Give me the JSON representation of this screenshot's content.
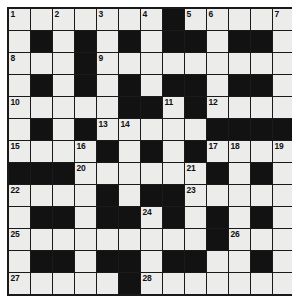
{
  "puzzle": {
    "type": "crossword-grid",
    "rows": 13,
    "cols": 13,
    "colors": {
      "white_cell": "#ececeb",
      "black_cell": "#121212",
      "grid_line": "#1a1a1a",
      "number_text": "#111111",
      "page_background": "#ffffff"
    },
    "layout": [
      [
        "W",
        "W",
        "W",
        "W",
        "W",
        "W",
        "W",
        "B",
        "W",
        "W",
        "W",
        "W",
        "W"
      ],
      [
        "W",
        "B",
        "W",
        "B",
        "W",
        "B",
        "W",
        "B",
        "B",
        "W",
        "B",
        "B",
        "W"
      ],
      [
        "W",
        "W",
        "W",
        "B",
        "W",
        "W",
        "W",
        "W",
        "W",
        "W",
        "W",
        "W",
        "W"
      ],
      [
        "W",
        "B",
        "W",
        "B",
        "W",
        "B",
        "W",
        "B",
        "B",
        "W",
        "B",
        "B",
        "W"
      ],
      [
        "W",
        "W",
        "W",
        "W",
        "W",
        "B",
        "B",
        "W",
        "B",
        "W",
        "W",
        "W",
        "W"
      ],
      [
        "W",
        "B",
        "W",
        "B",
        "W",
        "W",
        "W",
        "W",
        "W",
        "B",
        "B",
        "B",
        "B"
      ],
      [
        "W",
        "W",
        "W",
        "W",
        "B",
        "W",
        "B",
        "W",
        "B",
        "W",
        "W",
        "W",
        "W"
      ],
      [
        "B",
        "B",
        "B",
        "W",
        "W",
        "W",
        "W",
        "W",
        "W",
        "B",
        "W",
        "B",
        "W"
      ],
      [
        "W",
        "W",
        "W",
        "W",
        "B",
        "W",
        "B",
        "B",
        "W",
        "W",
        "W",
        "W",
        "W"
      ],
      [
        "W",
        "B",
        "B",
        "W",
        "B",
        "B",
        "W",
        "B",
        "W",
        "B",
        "W",
        "B",
        "W"
      ],
      [
        "W",
        "W",
        "W",
        "W",
        "W",
        "W",
        "W",
        "W",
        "W",
        "B",
        "W",
        "W",
        "W"
      ],
      [
        "W",
        "B",
        "B",
        "W",
        "B",
        "B",
        "W",
        "B",
        "B",
        "W",
        "W",
        "B",
        "W"
      ],
      [
        "W",
        "W",
        "W",
        "W",
        "W",
        "B",
        "W",
        "W",
        "W",
        "W",
        "W",
        "W",
        "W"
      ]
    ],
    "numbers": [
      {
        "row": 0,
        "col": 0,
        "n": "1"
      },
      {
        "row": 0,
        "col": 2,
        "n": "2"
      },
      {
        "row": 0,
        "col": 4,
        "n": "3"
      },
      {
        "row": 0,
        "col": 6,
        "n": "4"
      },
      {
        "row": 0,
        "col": 8,
        "n": "5"
      },
      {
        "row": 0,
        "col": 9,
        "n": "6"
      },
      {
        "row": 0,
        "col": 12,
        "n": "7"
      },
      {
        "row": 2,
        "col": 0,
        "n": "8"
      },
      {
        "row": 2,
        "col": 4,
        "n": "9"
      },
      {
        "row": 4,
        "col": 0,
        "n": "10"
      },
      {
        "row": 4,
        "col": 7,
        "n": "11"
      },
      {
        "row": 4,
        "col": 9,
        "n": "12"
      },
      {
        "row": 5,
        "col": 4,
        "n": "13"
      },
      {
        "row": 5,
        "col": 5,
        "n": "14"
      },
      {
        "row": 6,
        "col": 0,
        "n": "15"
      },
      {
        "row": 6,
        "col": 3,
        "n": "16"
      },
      {
        "row": 6,
        "col": 9,
        "n": "17"
      },
      {
        "row": 6,
        "col": 10,
        "n": "18"
      },
      {
        "row": 6,
        "col": 12,
        "n": "19"
      },
      {
        "row": 7,
        "col": 3,
        "n": "20"
      },
      {
        "row": 7,
        "col": 8,
        "n": "21"
      },
      {
        "row": 8,
        "col": 0,
        "n": "22"
      },
      {
        "row": 8,
        "col": 8,
        "n": "23"
      },
      {
        "row": 9,
        "col": 6,
        "n": "24"
      },
      {
        "row": 10,
        "col": 0,
        "n": "25"
      },
      {
        "row": 10,
        "col": 10,
        "n": "26"
      },
      {
        "row": 12,
        "col": 0,
        "n": "27"
      },
      {
        "row": 12,
        "col": 6,
        "n": "28"
      }
    ]
  }
}
